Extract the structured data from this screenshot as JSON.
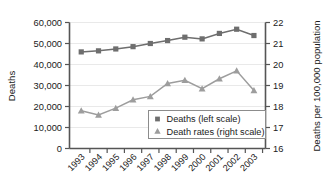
{
  "chart_data": {
    "type": "line",
    "title": "",
    "subtitle": "",
    "xlabel": "",
    "ylabel": "Deaths",
    "y2label": "Deaths per 100,000 population",
    "grid": true,
    "legend_position": "inside-bottom-right",
    "categories": [
      "1993",
      "1994",
      "1995",
      "1996",
      "1997",
      "1998",
      "1999",
      "2000",
      "2001",
      "2002",
      "2003"
    ],
    "ylim": [
      0,
      60000
    ],
    "yticks": [
      0,
      10000,
      20000,
      30000,
      40000,
      50000,
      60000
    ],
    "ytick_labels": [
      "0",
      "10,000",
      "20,000",
      "30,000",
      "40,000",
      "50,000",
      "60,000"
    ],
    "y2lim": [
      16,
      22
    ],
    "y2ticks": [
      16,
      17,
      18,
      19,
      20,
      21,
      22
    ],
    "y2tick_labels": [
      "16",
      "17",
      "18",
      "19",
      "20",
      "21",
      "22"
    ],
    "series": [
      {
        "name": "Deaths (left scale)",
        "axis": "left",
        "marker": "square",
        "color": "#6e6e6e",
        "values": [
          46000,
          46500,
          47400,
          48500,
          50000,
          51400,
          53000,
          52200,
          54800,
          56800,
          53800
        ]
      },
      {
        "name": "Death rates (right scale)",
        "axis": "right",
        "marker": "triangle",
        "color": "#9d9d9d",
        "values": [
          17.8,
          17.6,
          17.92,
          18.32,
          18.48,
          19.1,
          19.25,
          18.85,
          19.32,
          19.7,
          18.76
        ]
      }
    ]
  },
  "legend": {
    "entries": [
      {
        "label": "Deaths (left scale)",
        "marker": "square-marker"
      },
      {
        "label": "Death rates (right scale)",
        "marker": "triangle-marker"
      }
    ]
  },
  "colors": {
    "series_deaths": "#6e6e6e",
    "series_rates": "#9d9d9d",
    "axis": "#555555",
    "grid": "#e9e9e9",
    "text": "#1a1a1a",
    "background": "#ffffff"
  }
}
